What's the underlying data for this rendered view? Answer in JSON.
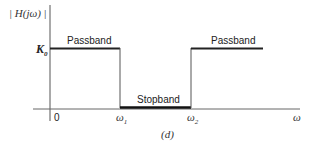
{
  "figure": {
    "caption": "(d)",
    "y_axis_label": "| H(jω) |",
    "x_axis_label": "ω",
    "level_label": "K",
    "level_label_sub": "0",
    "tick_labels": [
      {
        "text": "0",
        "sub": ""
      },
      {
        "text": "ω",
        "sub": "1"
      },
      {
        "text": "ω",
        "sub": "2"
      }
    ],
    "regions": [
      {
        "name": "Passband",
        "label": "Passband"
      },
      {
        "name": "Stopband",
        "label": "Stopband"
      },
      {
        "name": "Passband",
        "label": "Passband"
      }
    ]
  },
  "colors": {
    "line": "#222222",
    "axis": "#444444",
    "text": "#222222"
  }
}
